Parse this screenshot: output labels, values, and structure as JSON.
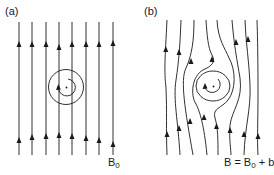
{
  "figure": {
    "panels": [
      {
        "id": "a",
        "label": "(a)",
        "description": "Uniform background magnetic field lines with a circular current loop",
        "field_label": {
          "main": "B",
          "sub": "0",
          "rest": ""
        },
        "line_count": 8
      },
      {
        "id": "b",
        "label": "(b)",
        "description": "Perturbed field lines wrapping around a magnetic island (total field)",
        "field_label": {
          "main": "B = B",
          "sub": "0",
          "rest": " + b"
        },
        "line_count": 8
      }
    ],
    "colors": {
      "line": "#1a1a1a",
      "background": "#ffffff"
    }
  }
}
